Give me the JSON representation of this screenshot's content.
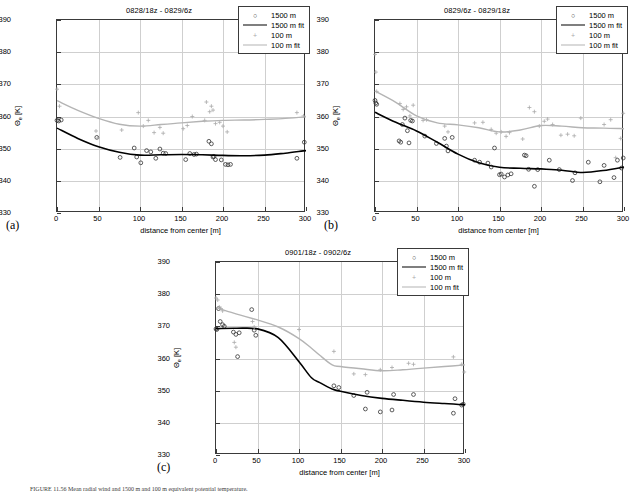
{
  "figure": {
    "panel_labels": [
      "(a)",
      "(b)",
      "(c)"
    ],
    "caption": "FIGURE 11.56   Mean radial wind and 1500 m and 100 m equivalent potential temperature."
  },
  "axes": {
    "xlabel": "distance from center [m]",
    "ylabel_main": "Θ",
    "ylabel_sub": "e",
    "ylabel_unit": " [K]",
    "xlim": [
      0,
      300
    ],
    "ylim": [
      330,
      390
    ],
    "xticks": [
      0,
      50,
      100,
      150,
      200,
      250,
      300
    ],
    "yticks": [
      330,
      340,
      350,
      360,
      370,
      380,
      390
    ],
    "grid": true
  },
  "legend": {
    "position": "top-right",
    "entries": [
      {
        "label": "1500 m",
        "kind": "marker",
        "symbol": "circle",
        "color": "#333333"
      },
      {
        "label": "1500 m fit",
        "kind": "line",
        "symbol": "line",
        "color": "#000000"
      },
      {
        "label": "100 m",
        "kind": "marker",
        "symbol": "plus",
        "color": "#aaaaaa"
      },
      {
        "label": "100 m fit",
        "kind": "line",
        "symbol": "line",
        "color": "#b4b4b4"
      }
    ]
  },
  "colors": {
    "dark_fit": "#000000",
    "light_fit": "#b4b4b4",
    "dark_marker": "#333333",
    "light_marker": "#aaaaaa",
    "grid": "#cfcfcf",
    "axis": "#3a3a3a"
  },
  "chart_data": [
    {
      "type": "scatter",
      "panel": "(a)",
      "title": "0828/18z - 0829/6z",
      "xlabel": "distance from center [m]",
      "ylabel": "Θe [K]",
      "xlim": [
        0,
        300
      ],
      "ylim": [
        330,
        390
      ],
      "grid": true,
      "legend_position": "top-right",
      "series": [
        {
          "name": "1500 m",
          "kind": "scatter",
          "marker": "circle",
          "x": [
            0,
            2,
            5,
            48,
            76,
            93,
            96,
            101,
            108,
            113,
            119,
            124,
            128,
            131,
            155,
            160,
            165,
            168,
            183,
            186,
            188,
            189,
            191,
            198,
            203,
            206,
            209,
            289,
            298
          ],
          "y": [
            358.8,
            358.6,
            358.9,
            353.5,
            347.3,
            350.2,
            347.4,
            345.6,
            349.4,
            349.0,
            347.0,
            349.9,
            348.6,
            348.5,
            346.6,
            348.5,
            348.2,
            348.3,
            352.3,
            351.5,
            347.4,
            347.6,
            346.6,
            346.5,
            345.1,
            345.0,
            345.1,
            347.0,
            352.0
          ]
        },
        {
          "name": "1500 m fit",
          "kind": "line",
          "x": [
            0,
            25,
            50,
            75,
            100,
            125,
            150,
            175,
            200,
            225,
            250,
            275,
            300
          ],
          "y": [
            356.4,
            353.2,
            350.6,
            348.9,
            348.0,
            348.1,
            348.2,
            348.1,
            347.9,
            347.8,
            348.0,
            348.6,
            349.4
          ]
        },
        {
          "name": "100 m",
          "kind": "scatter",
          "marker": "plus",
          "x": [
            0,
            3,
            47,
            49,
            78,
            98,
            104,
            110,
            117,
            124,
            128,
            152,
            157,
            163,
            178,
            180,
            184,
            186,
            188,
            191,
            196,
            200,
            205,
            289,
            297
          ],
          "y": [
            368.5,
            363.2,
            355.5,
            353.3,
            355.8,
            361.2,
            357.0,
            358.8,
            355.0,
            356.6,
            354.8,
            356.2,
            357.2,
            360.0,
            358.8,
            364.5,
            361.5,
            363.2,
            362.0,
            357.8,
            358.2,
            357.0,
            355.2,
            361.2,
            360.2
          ]
        },
        {
          "name": "100 m fit",
          "kind": "line",
          "x": [
            0,
            25,
            50,
            75,
            100,
            125,
            150,
            175,
            200,
            225,
            250,
            275,
            300
          ],
          "y": [
            364.9,
            361.9,
            359.4,
            357.6,
            357.0,
            357.5,
            358.0,
            358.5,
            358.8,
            358.9,
            359.1,
            359.4,
            359.9
          ]
        }
      ]
    },
    {
      "type": "scatter",
      "panel": "(b)",
      "title": "0829/6z - 0829/18z",
      "xlabel": "distance from center [m]",
      "ylabel": "Θe [K]",
      "xlim": [
        0,
        300
      ],
      "ylim": [
        330,
        390
      ],
      "grid": true,
      "legend_position": "top-right",
      "series": [
        {
          "name": "1500 m",
          "kind": "scatter",
          "marker": "circle",
          "x": [
            0,
            1,
            2,
            29,
            31,
            33,
            36,
            39,
            41,
            43,
            45,
            60,
            74,
            84,
            86,
            88,
            93,
            120,
            126,
            136,
            140,
            144,
            150,
            152,
            156,
            160,
            164,
            180,
            182,
            185,
            192,
            196,
            210,
            222,
            238,
            241,
            257,
            271,
            276,
            288,
            292,
            297,
            299
          ],
          "y": [
            365.0,
            364.2,
            363.8,
            352.4,
            352.0,
            357.5,
            359.5,
            355.6,
            351.8,
            358.8,
            358.6,
            353.9,
            351.6,
            353.2,
            350.8,
            349.3,
            353.5,
            346.4,
            345.8,
            345.5,
            344.3,
            350.2,
            341.9,
            342.1,
            341.2,
            341.8,
            342.2,
            348.0,
            347.8,
            343.6,
            338.3,
            343.5,
            346.4,
            343.5,
            340.1,
            342.5,
            345.8,
            339.7,
            344.8,
            341.0,
            346.4,
            344.0,
            347.1
          ]
        },
        {
          "name": "1500 m fit",
          "kind": "line",
          "x": [
            0,
            25,
            50,
            75,
            100,
            125,
            150,
            175,
            200,
            225,
            250,
            275,
            300
          ],
          "y": [
            361.3,
            358.2,
            355.5,
            352.0,
            348.3,
            345.6,
            344.2,
            343.9,
            343.7,
            343.3,
            342.6,
            343.2,
            344.3
          ]
        },
        {
          "name": "100 m",
          "kind": "scatter",
          "marker": "plus",
          "x": [
            0,
            1,
            2,
            30,
            34,
            38,
            42,
            46,
            58,
            62,
            84,
            88,
            120,
            130,
            140,
            146,
            152,
            158,
            162,
            178,
            186,
            192,
            198,
            204,
            208,
            214,
            224,
            232,
            240,
            248,
            276,
            284,
            290,
            296,
            299
          ],
          "y": [
            379.3,
            373.8,
            367.8,
            364.0,
            362.2,
            363.0,
            360.2,
            363.5,
            358.8,
            359.0,
            357.0,
            355.2,
            358.0,
            358.2,
            356.0,
            354.8,
            355.2,
            353.8,
            355.0,
            353.0,
            362.8,
            361.5,
            357.0,
            358.5,
            359.2,
            357.5,
            354.2,
            354.5,
            354.0,
            359.5,
            357.5,
            359.0,
            347.2,
            353.2,
            361.0
          ]
        },
        {
          "name": "100 m fit",
          "kind": "line",
          "x": [
            0,
            25,
            50,
            75,
            100,
            125,
            150,
            175,
            200,
            225,
            250,
            275,
            300
          ],
          "y": [
            367.9,
            364.4,
            360.2,
            358.0,
            357.4,
            356.5,
            355.2,
            355.8,
            357.2,
            357.0,
            356.5,
            356.4,
            356.2
          ]
        }
      ]
    },
    {
      "type": "scatter",
      "panel": "(c)",
      "title": "0901/18z - 0902/6z",
      "xlabel": "distance from center [m]",
      "ylabel": "Θe [K]",
      "xlim": [
        0,
        300
      ],
      "ylim": [
        330,
        390
      ],
      "grid": true,
      "legend_position": "top-right",
      "series": [
        {
          "name": "1500 m",
          "kind": "scatter",
          "marker": "circle",
          "x": [
            0,
            1,
            3,
            5,
            8,
            10,
            21,
            24,
            26,
            28,
            43,
            46,
            48,
            142,
            148,
            166,
            180,
            182,
            198,
            212,
            214,
            238,
            286,
            288,
            296,
            298
          ],
          "y": [
            369.2,
            369.0,
            375.5,
            371.5,
            370.5,
            370.0,
            368.2,
            367.5,
            360.6,
            368.0,
            375.2,
            368.8,
            367.2,
            351.5,
            351.0,
            348.5,
            344.3,
            349.5,
            343.4,
            344.0,
            348.8,
            348.8,
            343.0,
            347.5,
            345.5,
            345.8
          ]
        },
        {
          "name": "1500 m fit",
          "kind": "line",
          "x": [
            0,
            25,
            50,
            75,
            100,
            115,
            125,
            140,
            150,
            175,
            200,
            225,
            250,
            275,
            300
          ],
          "y": [
            369.3,
            369.4,
            369.2,
            366.5,
            359.0,
            354.0,
            352.5,
            350.5,
            349.8,
            348.5,
            347.6,
            347.0,
            346.4,
            346.0,
            345.6
          ]
        },
        {
          "name": "100 m",
          "kind": "scatter",
          "marker": "plus",
          "x": [
            0,
            2,
            4,
            6,
            8,
            22,
            24,
            44,
            46,
            100,
            142,
            166,
            180,
            198,
            212,
            232,
            238,
            286,
            296,
            299
          ],
          "y": [
            378.8,
            378.2,
            376.0,
            375.5,
            374.8,
            365.0,
            363.5,
            371.5,
            369.8,
            369.0,
            362.2,
            355.2,
            355.0,
            356.5,
            357.2,
            358.5,
            358.2,
            360.5,
            358.2,
            355.8
          ]
        },
        {
          "name": "100 m fit",
          "kind": "line",
          "x": [
            0,
            25,
            50,
            75,
            100,
            115,
            125,
            140,
            150,
            175,
            200,
            225,
            250,
            275,
            300
          ],
          "y": [
            375.8,
            373.8,
            372.0,
            369.8,
            366.2,
            363.2,
            361.0,
            358.0,
            357.5,
            356.8,
            356.2,
            356.5,
            357.0,
            357.5,
            358.0
          ]
        }
      ]
    }
  ]
}
